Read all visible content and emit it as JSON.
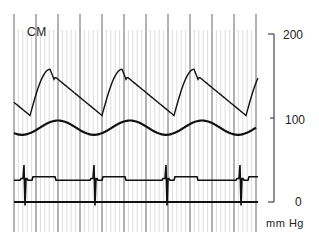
{
  "chart_data": {
    "type": "line",
    "title": "",
    "left_label": "CM",
    "xlabel": "",
    "ylabel": "mm Hg",
    "ylim": [
      0,
      200
    ],
    "yticks": [
      "200",
      "100",
      "0"
    ],
    "grid": {
      "vertical_lines": true,
      "major_spacing_px": 22,
      "minor_per_major": 5
    },
    "legend": null,
    "series": [
      {
        "name": "pressure waveform",
        "approx_values_mmHg": {
          "peaks": [
            158,
            158,
            158
          ],
          "troughs": [
            103,
            101,
            103,
            99
          ],
          "end_upstroke": 142
        },
        "cycles": 3
      },
      {
        "name": "slow undulating trace",
        "approx_values_mmHg": {
          "max": 97,
          "min": 80
        },
        "cycles": 3
      },
      {
        "name": "ECG trace",
        "approx_values_mmHg": {
          "baseline": 26,
          "spike_max": 38
        },
        "spikes": 4
      },
      {
        "name": "zero baseline",
        "approx_values_mmHg": {
          "value": 0
        }
      }
    ]
  },
  "labels": {
    "cm": "CM",
    "tick_200": "200",
    "tick_100": "100",
    "tick_0": "0",
    "unit": "mm Hg"
  }
}
